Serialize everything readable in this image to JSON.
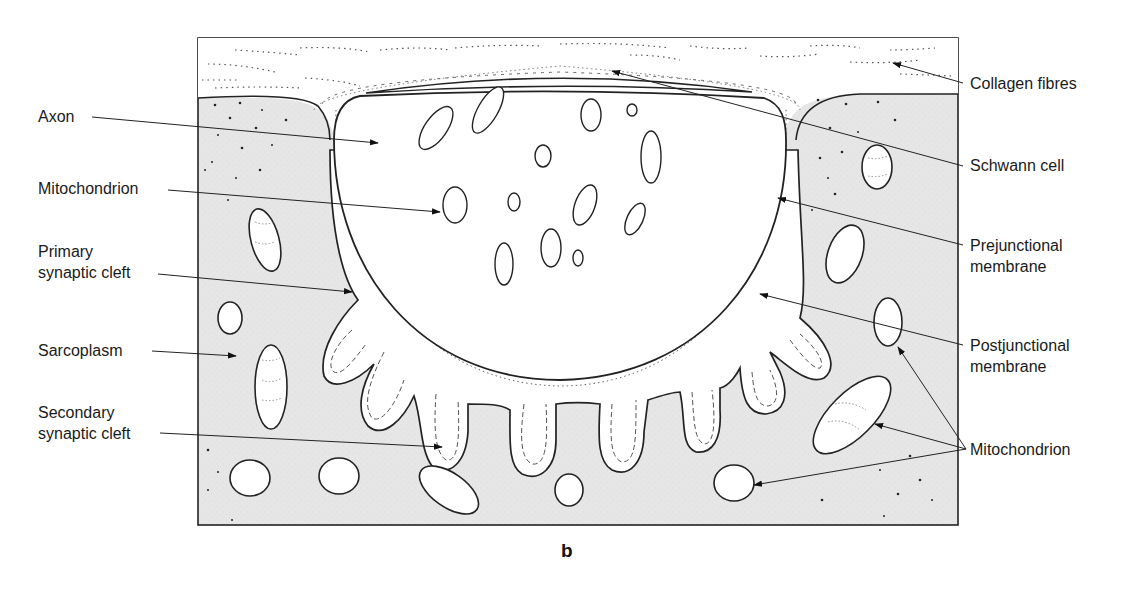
{
  "figure": {
    "panel_letter": "b",
    "colors": {
      "sarcoplasm_fill": "#e6e6e6",
      "outline": "#222222",
      "background": "#ffffff",
      "label_text": "#1a1a1a"
    }
  },
  "labels_left": [
    {
      "id": "axon",
      "text": "Axon"
    },
    {
      "id": "mitochondrion-left",
      "text": "Mitochondrion"
    },
    {
      "id": "primary-synaptic-cleft",
      "text": "Primary\nsynaptic cleft"
    },
    {
      "id": "sarcoplasm",
      "text": "Sarcoplasm"
    },
    {
      "id": "secondary-synaptic-cleft",
      "text": "Secondary\nsynaptic cleft"
    }
  ],
  "labels_right": [
    {
      "id": "collagen-fibres",
      "text": "Collagen fibres"
    },
    {
      "id": "schwann-cell",
      "text": "Schwann cell"
    },
    {
      "id": "prejunctional-membrane",
      "text": "Prejunctional\nmembrane"
    },
    {
      "id": "postjunctional-membrane",
      "text": "Postjunctional\nmembrane"
    },
    {
      "id": "mitochondrion-right",
      "text": "Mitochondrion"
    }
  ]
}
